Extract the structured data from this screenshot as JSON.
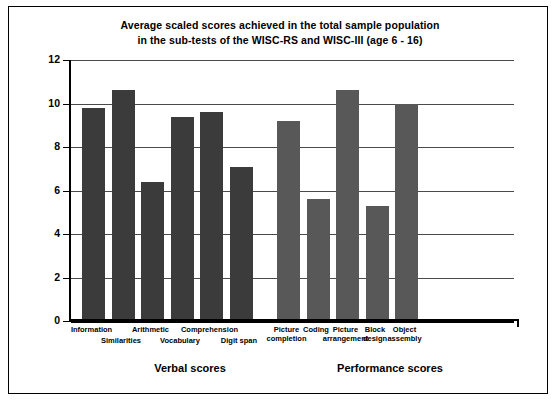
{
  "figure": {
    "title_line1": "Average scaled scores achieved in the total sample population",
    "title_line2": "in the sub-tests of the WISC-RS and WISC-III (age 6 - 16)"
  },
  "axis": {
    "y_ticks": [
      "12",
      "10",
      "8",
      "6",
      "4",
      "2",
      "0"
    ],
    "y_min": 0,
    "y_max": 12,
    "y_step": 2
  },
  "groups": [
    {
      "label": "Verbal scores"
    },
    {
      "label": "Performance scores"
    }
  ],
  "bars": [
    {
      "label_line1": "Information",
      "label_line2": "",
      "value": 9.8,
      "group": "verbal",
      "row": 1
    },
    {
      "label_line1": "Similarities",
      "label_line2": "",
      "value": 10.6,
      "group": "verbal",
      "row": 2
    },
    {
      "label_line1": "Arithmetic",
      "label_line2": "",
      "value": 6.4,
      "group": "verbal",
      "row": 1
    },
    {
      "label_line1": "Vocabulary",
      "label_line2": "",
      "value": 9.4,
      "group": "verbal",
      "row": 2
    },
    {
      "label_line1": "Comprehension",
      "label_line2": "",
      "value": 9.6,
      "group": "verbal",
      "row": 1
    },
    {
      "label_line1": "Digit span",
      "label_line2": "",
      "value": 7.1,
      "group": "verbal",
      "row": 2
    },
    {
      "label_line1": "Picture",
      "label_line2": "completion",
      "value": 9.2,
      "group": "performance",
      "row": 1
    },
    {
      "label_line1": "Coding",
      "label_line2": "",
      "value": 5.6,
      "group": "performance",
      "row": 1
    },
    {
      "label_line1": "Picture",
      "label_line2": "arrangement",
      "value": 10.6,
      "group": "performance",
      "row": 1
    },
    {
      "label_line1": "Block",
      "label_line2": "design",
      "value": 5.3,
      "group": "performance",
      "row": 1
    },
    {
      "label_line1": "Object",
      "label_line2": "assembly",
      "value": 10.0,
      "group": "performance",
      "row": 1
    }
  ],
  "colors": {
    "verbal_bar": "#3b3b3b",
    "performance_bar": "#585858",
    "axis": "#000000",
    "gridline": "#4a4a4a",
    "background": "#ffffff"
  },
  "chart_data": {
    "type": "bar",
    "title": "Average scaled scores achieved in the total sample population in the sub-tests of the WISC-RS and WISC-III (age 6 - 16)",
    "xlabel": "",
    "ylabel": "",
    "ylim": [
      0,
      12
    ],
    "ytick_values": [
      0,
      2,
      4,
      6,
      8,
      10,
      12
    ],
    "grid": true,
    "legend": "none",
    "categories": [
      "Information",
      "Similarities",
      "Arithmetic",
      "Vocabulary",
      "Comprehension",
      "Digit span",
      "Picture completion",
      "Coding",
      "Picture arrangement",
      "Block design",
      "Object assembly"
    ],
    "values": [
      9.8,
      10.6,
      6.4,
      9.4,
      9.6,
      7.1,
      9.2,
      5.6,
      10.6,
      5.3,
      10.0
    ],
    "group_spans": [
      {
        "name": "Verbal scores",
        "categories": [
          "Information",
          "Similarities",
          "Arithmetic",
          "Vocabulary",
          "Comprehension",
          "Digit span"
        ]
      },
      {
        "name": "Performance scores",
        "categories": [
          "Picture completion",
          "Coding",
          "Picture arrangement",
          "Block design",
          "Object assembly"
        ]
      }
    ]
  }
}
